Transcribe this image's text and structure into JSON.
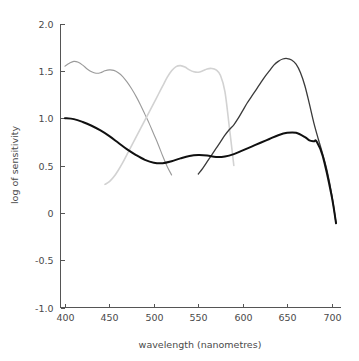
{
  "chart_data": {
    "type": "line",
    "title": "",
    "xlabel": "wavelength (nanometres)",
    "ylabel": "log of sensitivity",
    "xlim": [
      395,
      710
    ],
    "ylim": [
      -1.0,
      2.0
    ],
    "grid": false,
    "legend_position": "none",
    "xticks": [
      400,
      450,
      500,
      550,
      600,
      650,
      700
    ],
    "xticklabels": [
      "400",
      "450",
      "500",
      "550",
      "600",
      "650",
      "700"
    ],
    "yticks": [
      -1.0,
      -0.5,
      0,
      0.5,
      1.0,
      1.5,
      2.0
    ],
    "yticklabels": [
      "-1.0",
      "-0.5",
      "0",
      "0.5",
      "1.0",
      "1.5",
      "2.0"
    ],
    "series": [
      {
        "name": "short-wavelength-curve",
        "color": "#9a9a9a",
        "linewidth": 1.1,
        "x": [
          400,
          405,
          410,
          415,
          420,
          425,
          430,
          435,
          440,
          445,
          450,
          455,
          460,
          465,
          470,
          475,
          480,
          485,
          490,
          495,
          500,
          505,
          510,
          515,
          520
        ],
        "y": [
          1.55,
          1.58,
          1.6,
          1.59,
          1.56,
          1.52,
          1.49,
          1.475,
          1.48,
          1.5,
          1.51,
          1.505,
          1.48,
          1.44,
          1.38,
          1.31,
          1.23,
          1.14,
          1.04,
          0.94,
          0.83,
          0.72,
          0.6,
          0.49,
          0.4
        ]
      },
      {
        "name": "middle-wavelength-curve",
        "color": "#d2d2d2",
        "linewidth": 1.6,
        "x": [
          445,
          450,
          455,
          460,
          465,
          470,
          475,
          480,
          485,
          490,
          495,
          500,
          505,
          510,
          515,
          520,
          525,
          530,
          535,
          540,
          545,
          550,
          555,
          560,
          565,
          570,
          575,
          580,
          585,
          590
        ],
        "y": [
          0.3,
          0.33,
          0.38,
          0.45,
          0.53,
          0.62,
          0.71,
          0.8,
          0.89,
          0.98,
          1.07,
          1.16,
          1.25,
          1.34,
          1.43,
          1.5,
          1.545,
          1.555,
          1.54,
          1.51,
          1.49,
          1.485,
          1.5,
          1.52,
          1.525,
          1.51,
          1.45,
          1.28,
          0.9,
          0.5
        ]
      },
      {
        "name": "long-wavelength-curve",
        "color": "#3a3a3a",
        "linewidth": 1.3,
        "x": [
          550,
          555,
          560,
          565,
          570,
          575,
          580,
          585,
          590,
          595,
          600,
          605,
          610,
          615,
          620,
          625,
          630,
          635,
          640,
          645,
          650,
          655,
          660,
          665,
          670,
          675,
          680,
          685,
          690,
          695,
          700,
          705
        ],
        "y": [
          0.41,
          0.47,
          0.54,
          0.61,
          0.68,
          0.75,
          0.82,
          0.88,
          0.93,
          1.0,
          1.08,
          1.16,
          1.23,
          1.3,
          1.37,
          1.44,
          1.5,
          1.56,
          1.6,
          1.625,
          1.63,
          1.615,
          1.57,
          1.48,
          1.34,
          1.15,
          0.95,
          0.78,
          0.62,
          0.44,
          0.2,
          -0.11
        ]
      },
      {
        "name": "luminance-curve",
        "color": "#101010",
        "linewidth": 2.0,
        "x": [
          400,
          410,
          420,
          430,
          440,
          450,
          460,
          470,
          480,
          490,
          500,
          510,
          520,
          530,
          540,
          550,
          560,
          570,
          580,
          590,
          600,
          610,
          620,
          630,
          640,
          650,
          660,
          670,
          675,
          680,
          683,
          690,
          700,
          705
        ],
        "y": [
          1.0,
          0.99,
          0.96,
          0.92,
          0.87,
          0.81,
          0.74,
          0.67,
          0.61,
          0.56,
          0.53,
          0.525,
          0.545,
          0.575,
          0.6,
          0.61,
          0.605,
          0.59,
          0.595,
          0.62,
          0.66,
          0.7,
          0.74,
          0.78,
          0.82,
          0.845,
          0.845,
          0.8,
          0.765,
          0.755,
          0.755,
          0.6,
          0.18,
          -0.11
        ]
      }
    ]
  },
  "axes": {
    "x_title": "wavelength (nanometres)",
    "y_title": "log of sensitivity"
  }
}
